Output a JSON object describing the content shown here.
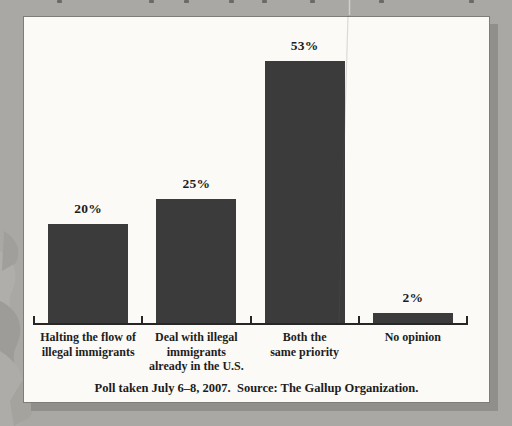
{
  "page": {
    "background_color": "#a9a8a5",
    "panel_color": "#fbfaf6"
  },
  "chart_data": {
    "type": "bar",
    "title": "",
    "xlabel": "",
    "ylabel": "",
    "unit": "percent",
    "ylim": [
      0,
      60
    ],
    "grid": false,
    "legend": "none",
    "bar_color": "#3b3b3b",
    "categories": [
      "Halting the flow of illegal immigrants",
      "Deal with illegal immigrants already in the U.S.",
      "Both the same priority",
      "No opinion"
    ],
    "category_label_lines": [
      [
        "Halting the flow of",
        "illegal immigrants"
      ],
      [
        "Deal with illegal",
        "immigrants",
        "already in the U.S."
      ],
      [
        "Both the",
        "same priority"
      ],
      [
        "No opinion"
      ]
    ],
    "values": [
      20,
      25,
      53,
      2
    ],
    "value_labels": [
      "20%",
      "25%",
      "53%",
      "2%"
    ],
    "source_note": "Poll taken July 6–8, 2007.  Source: The Gallup Organization."
  }
}
